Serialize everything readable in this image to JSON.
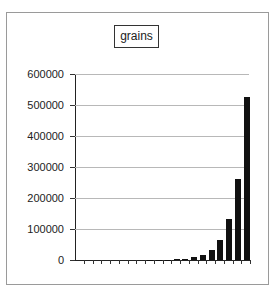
{
  "chart_data": {
    "type": "bar",
    "title": "grains",
    "xlabel": "",
    "ylabel": "",
    "categories": [
      "1",
      "2",
      "3",
      "4",
      "5",
      "6",
      "7",
      "8",
      "9",
      "10",
      "11",
      "12",
      "13",
      "14",
      "15",
      "16",
      "17",
      "18",
      "19",
      "20"
    ],
    "values": [
      1,
      2,
      4,
      8,
      16,
      32,
      64,
      128,
      256,
      512,
      1024,
      2048,
      4096,
      8192,
      16384,
      32768,
      65536,
      131072,
      262144,
      524288
    ],
    "yticks": [
      "0",
      "100000",
      "200000",
      "300000",
      "400000",
      "500000",
      "600000"
    ],
    "ylim": [
      0,
      600000
    ],
    "grid": true,
    "legend": "none",
    "bar_color": "#111111"
  }
}
